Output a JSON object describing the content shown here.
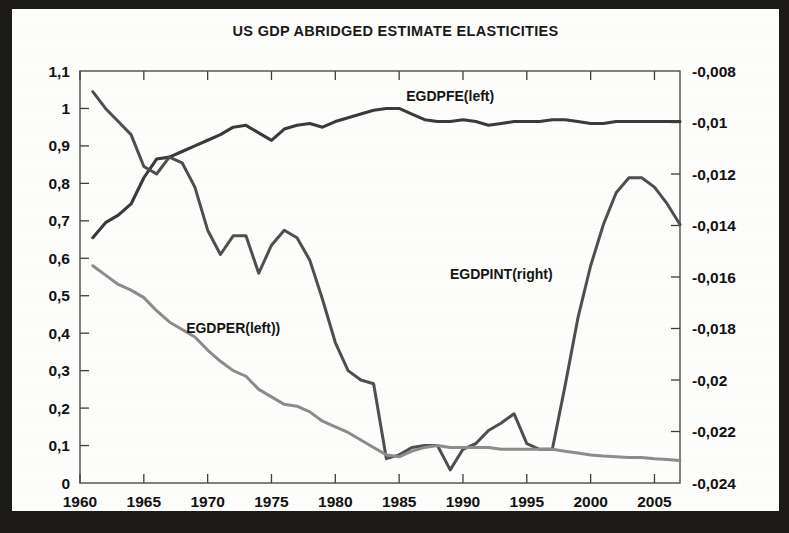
{
  "figure": {
    "title": "US GDP ABRIDGED ESTIMATE ELASTICITIES",
    "background_color": "#fdfdfb",
    "frame_color": "#1d1b1a"
  },
  "chart_data": {
    "type": "line",
    "title": "US GDP ABRIDGED ESTIMATE ELASTICITIES",
    "xlabel": "",
    "ylabel": "",
    "grid": false,
    "legend_position": "inline-annotations",
    "decimal_separator": ",",
    "xlim": [
      1960,
      2007
    ],
    "x_ticks": [
      1960,
      1965,
      1970,
      1975,
      1980,
      1985,
      1990,
      1995,
      2000,
      2005
    ],
    "x_tick_labels": [
      "1960",
      "1965",
      "1970",
      "1975",
      "1980",
      "1985",
      "1990",
      "1995",
      "2000",
      "2005"
    ],
    "left_axis": {
      "ylim": [
        0,
        1.1
      ],
      "ticks": [
        0,
        0.1,
        0.2,
        0.3,
        0.4,
        0.5,
        0.6,
        0.7,
        0.8,
        0.9,
        1,
        1.1
      ],
      "tick_labels": [
        "0",
        "0,1",
        "0,2",
        "0,3",
        "0,4",
        "0,5",
        "0,6",
        "0,7",
        "0,8",
        "0,9",
        "1",
        "1,1"
      ]
    },
    "right_axis": {
      "ylim": [
        -0.024,
        -0.008
      ],
      "ticks": [
        -0.024,
        -0.022,
        -0.02,
        -0.018,
        -0.016,
        -0.014,
        -0.012,
        -0.01,
        -0.008
      ],
      "tick_labels": [
        "-0,024",
        "-0,022",
        "-0,02",
        "-0,018",
        "-0,016",
        "-0,014",
        "-0,012",
        "-0,01",
        "-0,008"
      ]
    },
    "x": [
      1961,
      1962,
      1963,
      1964,
      1965,
      1966,
      1967,
      1968,
      1969,
      1970,
      1971,
      1972,
      1973,
      1974,
      1975,
      1976,
      1977,
      1978,
      1979,
      1980,
      1981,
      1982,
      1983,
      1984,
      1985,
      1986,
      1987,
      1988,
      1989,
      1990,
      1991,
      1992,
      1993,
      1994,
      1995,
      1996,
      1997,
      1998,
      1999,
      2000,
      2001,
      2002,
      2003,
      2004,
      2005,
      2006,
      2007
    ],
    "series": [
      {
        "name": "EGDPFE(left)",
        "label": "EGDPFE(left)",
        "axis": "left",
        "color": "#3a3a3a",
        "annotation_x": 1989,
        "annotation_y": 1.02,
        "values": [
          0.655,
          0.695,
          0.715,
          0.745,
          0.815,
          0.865,
          0.87,
          0.885,
          0.9,
          0.915,
          0.93,
          0.95,
          0.955,
          0.935,
          0.915,
          0.945,
          0.955,
          0.96,
          0.95,
          0.965,
          0.975,
          0.985,
          0.995,
          1.0,
          1.0,
          0.985,
          0.97,
          0.965,
          0.965,
          0.97,
          0.965,
          0.955,
          0.96,
          0.965,
          0.965,
          0.965,
          0.97,
          0.97,
          0.965,
          0.96,
          0.96,
          0.965,
          0.965,
          0.965,
          0.965,
          0.965,
          0.965
        ]
      },
      {
        "name": "EGDPINT(right)",
        "label": "EGDPINT(right)",
        "axis": "right",
        "color": "#4f4f4f",
        "annotation_x": 1993,
        "annotation_y_left_equiv": 0.545,
        "values_left_scale": [
          1.045,
          1.0,
          0.965,
          0.93,
          0.845,
          0.825,
          0.87,
          0.855,
          0.79,
          0.675,
          0.61,
          0.66,
          0.66,
          0.56,
          0.635,
          0.675,
          0.655,
          0.595,
          0.49,
          0.375,
          0.3,
          0.275,
          0.265,
          0.065,
          0.075,
          0.095,
          0.1,
          0.1,
          0.035,
          0.09,
          0.105,
          0.14,
          0.16,
          0.185,
          0.105,
          0.09,
          0.09,
          0.26,
          0.44,
          0.58,
          0.69,
          0.775,
          0.815,
          0.815,
          0.79,
          0.745,
          0.69
        ],
        "values": [
          -0.00881,
          -0.00945,
          -0.00996,
          -0.01047,
          -0.01171,
          -0.012,
          -0.01131,
          -0.01156,
          -0.0125,
          -0.01418,
          -0.01513,
          -0.0144,
          -0.0144,
          -0.01585,
          -0.01476,
          -0.01418,
          -0.01447,
          -0.01535,
          -0.01687,
          -0.01855,
          -0.01964,
          -0.02,
          -0.02015,
          -0.02305,
          -0.02291,
          -0.02262,
          -0.02255,
          -0.02255,
          -0.02349,
          -0.02269,
          -0.02247,
          -0.02196,
          -0.02167,
          -0.02131,
          -0.02247,
          -0.02269,
          -0.02269,
          -0.02022,
          -0.01761,
          -0.01556,
          -0.01396,
          -0.01273,
          -0.01215,
          -0.01215,
          -0.01251,
          -0.01316,
          -0.01396
        ]
      },
      {
        "name": "EGDPER(left))",
        "label": "EGDPER(left))",
        "axis": "left",
        "color": "#8c8c8c",
        "annotation_x": 1972,
        "annotation_y": 0.4,
        "values": [
          0.58,
          0.555,
          0.53,
          0.515,
          0.495,
          0.46,
          0.43,
          0.41,
          0.39,
          0.355,
          0.325,
          0.3,
          0.285,
          0.25,
          0.23,
          0.21,
          0.205,
          0.19,
          0.165,
          0.15,
          0.135,
          0.115,
          0.095,
          0.075,
          0.07,
          0.085,
          0.095,
          0.1,
          0.095,
          0.095,
          0.095,
          0.095,
          0.09,
          0.09,
          0.09,
          0.09,
          0.09,
          0.085,
          0.08,
          0.075,
          0.072,
          0.07,
          0.068,
          0.068,
          0.065,
          0.063,
          0.06
        ]
      }
    ]
  }
}
